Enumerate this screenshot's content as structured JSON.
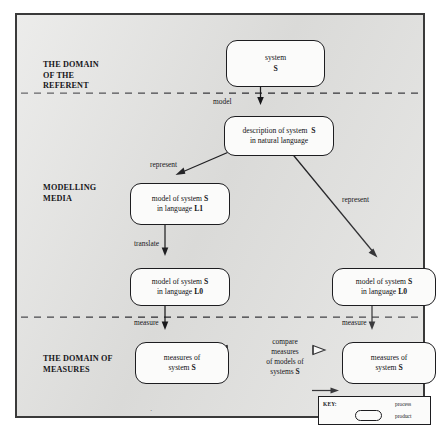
{
  "diagram": {
    "bands": [
      {
        "id": "referent",
        "label": "THE DOMAIN\nOF THE\nREFERENT"
      },
      {
        "id": "media",
        "label": "MODELLING\nMEDIA"
      },
      {
        "id": "measures",
        "label": "THE DOMAIN OF\nMEASURES"
      }
    ],
    "nodes": [
      {
        "id": "system",
        "line1": "system",
        "line2": "S"
      },
      {
        "id": "description",
        "line1": "description of system",
        "line1_bold": "S",
        "line2": "in natural language"
      },
      {
        "id": "model_l1",
        "line1": "model of system",
        "line1_bold": "S",
        "line2": "in language ",
        "line2_bold": "L1"
      },
      {
        "id": "model_l0_left",
        "line1": "model of system",
        "line1_bold": "S",
        "line2": "in language ",
        "line2_bold": "L0"
      },
      {
        "id": "model_l0_right",
        "line1": "model of system",
        "line1_bold": "S",
        "line2": "in language ",
        "line2_bold": "L0"
      },
      {
        "id": "measures_left",
        "line1": "measures of",
        "line2": "system ",
        "line2_bold": "S"
      },
      {
        "id": "measures_right",
        "line1": "measures of",
        "line2": "system ",
        "line2_bold": "S"
      }
    ],
    "edge_labels": {
      "model": "model",
      "represent_left": "represent",
      "represent_right": "represent",
      "translate": "translate",
      "measure_left": "measure",
      "measure_right": "measure"
    },
    "compare_label": {
      "line1": "compare",
      "line2": "measures",
      "line3": "of models of",
      "line4": "systems ",
      "line4_bold": "S"
    },
    "key": {
      "title": "KEY:",
      "process_label": "process",
      "product_label": "product"
    },
    "colors": {
      "paper": "#e2e2e0",
      "ink": "#18181b",
      "node_fill": "#fbfbfa",
      "frame": "#3a3a3a"
    }
  }
}
